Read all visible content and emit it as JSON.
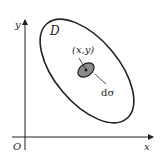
{
  "diagram": {
    "region_label": "D",
    "point_label": "(x,y)",
    "element_label": "dσ",
    "axes": {
      "x_label": "x",
      "y_label": "y",
      "origin_label": "O"
    },
    "colors": {
      "stroke": "#222222",
      "shaded": "#8a8a8a",
      "background": "#ffffff"
    }
  }
}
